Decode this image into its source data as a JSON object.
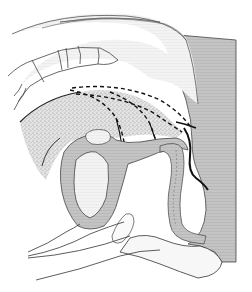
{
  "figure": {
    "type": "anatomical-sagittal-section",
    "labels": [],
    "colors": {
      "background": "#ffffff",
      "tissue_gray": "#b4b4b4",
      "light_gray": "#d6d6d6",
      "stipple": "#9a9a9a",
      "outline": "#333333",
      "white_fill": "#f6f6f6"
    },
    "regions": [
      "upper-arc-tissue",
      "vertebral-column",
      "stippled-mass",
      "dashed-contours",
      "central-organ",
      "inner-cavity",
      "tubular-channel",
      "right-posterior-block",
      "lower-bulb",
      "lower-contour-lines"
    ]
  }
}
